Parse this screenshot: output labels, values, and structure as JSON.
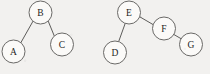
{
  "figure": {
    "background_color": "#f2f1ef",
    "node_fill_color": "#fbfaf8",
    "node_stroke_color": "#6a6967",
    "edge_color": "#5d5c5a",
    "label_color": "#1f1e1d",
    "node_radius": 11.5,
    "width": 210,
    "height": 74
  },
  "chart_data": {
    "type": "diagram",
    "diagram_kind": "binary-tree",
    "title": "",
    "trees": [
      {
        "name": "left-tree",
        "root": "B",
        "nodes": [
          {
            "id": "B",
            "label": "B",
            "cx": 40.5,
            "cy": 12.5,
            "r": 11.5
          },
          {
            "id": "A",
            "label": "A",
            "cx": 13.5,
            "cy": 51.5,
            "r": 11.5
          },
          {
            "id": "C",
            "label": "C",
            "cx": 62.0,
            "cy": 44.5,
            "r": 11.5
          }
        ],
        "edges": [
          {
            "from": "B",
            "to": "A",
            "x1": 33.0,
            "y1": 21.2,
            "x2": 20.5,
            "y2": 43.3
          },
          {
            "from": "B",
            "to": "C",
            "x1": 47.9,
            "y1": 20.4,
            "x2": 54.8,
            "y2": 37.2
          }
        ]
      },
      {
        "name": "right-tree",
        "root": "E",
        "nodes": [
          {
            "id": "E",
            "label": "E",
            "cx": 129.0,
            "cy": 12.5,
            "r": 11.5
          },
          {
            "id": "D",
            "label": "D",
            "cx": 115.0,
            "cy": 52.5,
            "r": 11.5
          },
          {
            "id": "F",
            "label": "F",
            "cx": 164.0,
            "cy": 28.5,
            "r": 11.5
          },
          {
            "id": "G",
            "label": "G",
            "cx": 191.0,
            "cy": 44.5,
            "r": 11.5
          }
        ],
        "edges": [
          {
            "from": "E",
            "to": "D",
            "x1": 125.2,
            "y1": 23.4,
            "x2": 118.8,
            "y2": 41.2
          },
          {
            "from": "E",
            "to": "F",
            "x1": 139.4,
            "y1": 16.6,
            "x2": 153.3,
            "y2": 24.7
          },
          {
            "from": "F",
            "to": "G",
            "x1": 173.7,
            "y1": 34.4,
            "x2": 181.4,
            "y2": 38.9
          }
        ]
      }
    ],
    "node_labels": [
      "A",
      "B",
      "C",
      "D",
      "E",
      "F",
      "G"
    ],
    "legend": [],
    "annotations": []
  }
}
